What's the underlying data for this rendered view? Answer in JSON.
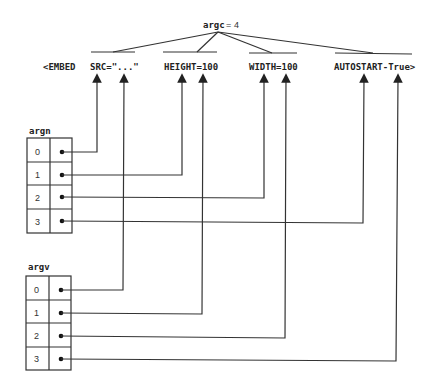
{
  "title": {
    "label": "argc",
    "eq": "=",
    "value": "4"
  },
  "tag_tokens": [
    {
      "text": "<EMBED",
      "x": 43
    },
    {
      "text": "SRC=\"...\"",
      "x": 90
    },
    {
      "text": "HEIGHT=100",
      "x": 164
    },
    {
      "text": "WIDTH=100",
      "x": 249
    },
    {
      "text": "AUTOSTART-True>",
      "x": 334
    }
  ],
  "arrays": [
    {
      "name": "argn",
      "indices": [
        "0",
        "1",
        "2",
        "3"
      ]
    },
    {
      "name": "argv",
      "indices": [
        "0",
        "1",
        "2",
        "3"
      ]
    }
  ],
  "mappings": {
    "argn": [
      "SRC",
      "HEIGHT",
      "WIDTH",
      "AUTOSTART"
    ],
    "argv": [
      "\"...\"",
      "100",
      "100",
      "True"
    ]
  }
}
